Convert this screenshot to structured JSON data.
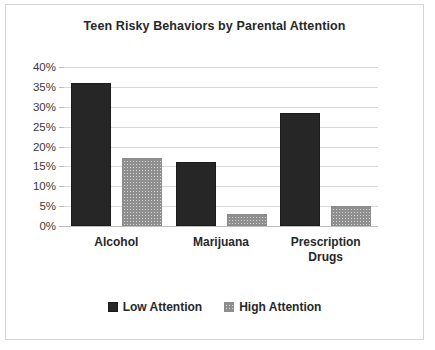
{
  "chart_data": {
    "type": "bar",
    "title": "Teen Risky Behaviors by Parental Attention",
    "xlabel": "",
    "ylabel": "",
    "categories": [
      "Alcohol",
      "Marijuana",
      "Prescription Drugs"
    ],
    "series": [
      {
        "name": "Low Attention",
        "values": [
          36,
          16,
          28.5
        ],
        "color": "#262626",
        "fill": "solid"
      },
      {
        "name": "High Attention",
        "values": [
          17,
          3,
          5
        ],
        "color": "#d6d6d6",
        "fill": "crosshatch"
      }
    ],
    "ylim": [
      0,
      40
    ],
    "yticks": [
      0,
      5,
      10,
      15,
      20,
      25,
      30,
      35,
      40
    ],
    "ytick_labels": [
      "0%",
      "5%",
      "10%",
      "15%",
      "20%",
      "25%",
      "30%",
      "35%",
      "40%"
    ],
    "grid": true,
    "legend_position": "bottom",
    "value_suffix": "%"
  },
  "frame": {
    "border_color": "#d4d4d4",
    "background": "#ffffff"
  }
}
